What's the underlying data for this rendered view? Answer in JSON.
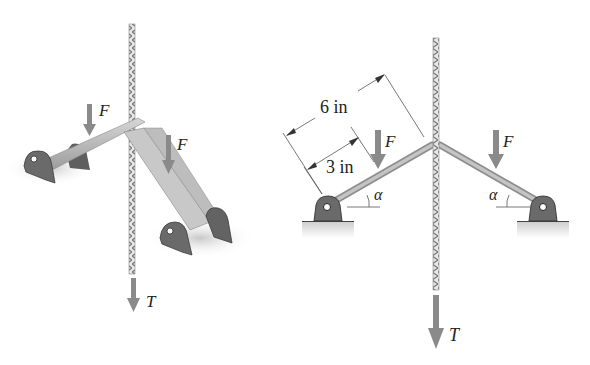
{
  "left_figure": {
    "description": "3D view of toggle mechanism: two links pinned to supports, joined at a rope",
    "labels": {
      "force_left": "F",
      "force_right": "F",
      "tension": "T"
    }
  },
  "right_figure": {
    "description": "2D schematic of toggle mechanism",
    "labels": {
      "force_left": "F",
      "force_right": "F",
      "tension": "T",
      "angle_left": "α",
      "angle_right": "α",
      "dim_outer": "6 in",
      "dim_inner": "3 in"
    }
  },
  "colors": {
    "arrow": "#8a8a8a",
    "link": "#b5b5b5",
    "support": "#6e6e6e",
    "ground": "#d8d8d8",
    "rope": "#9a9a9a"
  }
}
